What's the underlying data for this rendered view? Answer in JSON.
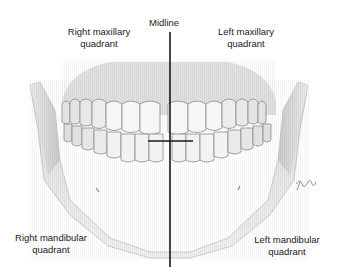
{
  "diagram": {
    "labels": {
      "midline": "Midline",
      "right_maxillary": [
        "Right maxillary",
        "quadrant"
      ],
      "left_maxillary": [
        "Left maxillary",
        "quadrant"
      ],
      "right_mandibular": [
        "Right mandibular",
        "quadrant"
      ],
      "left_mandibular": [
        "Left mandibular",
        "quadrant"
      ]
    },
    "colors": {
      "background": "#ffffff",
      "bone": "#e4e4e4",
      "bone_shade": "#bdbdbd",
      "tooth": "#f6f6f6",
      "tooth_outline": "#8a8a8a",
      "line": "#1a1a1a",
      "text": "#222222"
    },
    "signature": "artist signature"
  }
}
